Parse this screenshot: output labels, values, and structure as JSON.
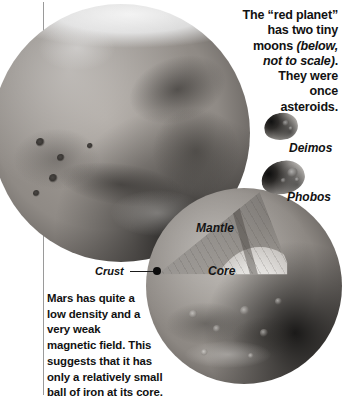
{
  "figure": {
    "subject": "Mars",
    "rule_color": "#9a9a9a",
    "background": "#ffffff"
  },
  "intro": {
    "line1": "The “red planet”",
    "line2": "has two tiny",
    "line3_plain": "moons ",
    "line3_italic": "(below,",
    "line4_italic": "not to scale)",
    "line4_plain": ".",
    "line5": "They were",
    "line6": "once",
    "line7": "asteroids."
  },
  "moons": [
    {
      "name": "Deimos",
      "label": "Deimos"
    },
    {
      "name": "Phobos",
      "label": "Phobos"
    }
  ],
  "cutaway": {
    "layers": [
      {
        "name": "Crust",
        "label": "Crust"
      },
      {
        "name": "Mantle",
        "label": "Mantle"
      },
      {
        "name": "Core",
        "label": "Core"
      }
    ]
  },
  "caption": {
    "line1": "Mars has quite a",
    "line2": "low density and a",
    "line3": "very weak",
    "line4": "magnetic field. This",
    "line5": "suggests that it has",
    "line6": "only a relatively small",
    "line7": "ball of iron at its core."
  }
}
